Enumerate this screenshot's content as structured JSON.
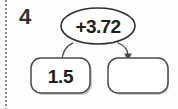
{
  "worksheet": {
    "problem_number": "4",
    "binding_icon": "dotted-perforation-rule"
  },
  "diagram": {
    "type": "function-machine",
    "operation_bubble": {
      "label": "+3.72",
      "shape": "ellipse",
      "icon": "operation-bubble-icon"
    },
    "input_box": {
      "value": "1.5",
      "shape": "rounded-rectangle",
      "filled": true
    },
    "output_box": {
      "value": "",
      "shape": "rounded-rectangle",
      "filled": false,
      "answer_blank": true
    },
    "arrows": [
      {
        "name": "input-to-operation",
        "from": "input-box",
        "to": "operation-bubble",
        "arrowhead": false
      },
      {
        "name": "operation-to-output",
        "from": "operation-bubble",
        "to": "output-box",
        "arrowhead": true,
        "arrowhead_icon": "arrowhead-down-icon"
      }
    ]
  },
  "colors": {
    "page_background": "#fdfdfd",
    "ink": "#1d1d1d",
    "stroke": "#3a3a3a",
    "box_stroke": "#4a4a4a",
    "shadow": "#c9c9c9",
    "binding": "#8e8e8e"
  }
}
